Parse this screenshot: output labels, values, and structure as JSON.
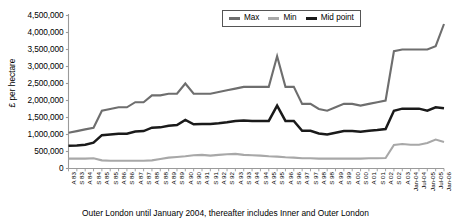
{
  "chart_data": {
    "type": "line",
    "title": "",
    "xlabel": "",
    "ylabel": "£ per hectare",
    "ylim": [
      0,
      4500000
    ],
    "ytick_values": [
      0,
      500000,
      1000000,
      1500000,
      2000000,
      2500000,
      3000000,
      3500000,
      4000000,
      4500000
    ],
    "ytick_labels": [
      "0",
      "500,000",
      "1,000,000",
      "1,500,000",
      "2,000,000",
      "2,500,000",
      "3,000,000",
      "3,500,000",
      "4,000,000",
      "4,500,000"
    ],
    "grid": false,
    "legend_position": "top-center",
    "categories": [
      "A 83",
      "S 83",
      "A 84",
      "S 84",
      "A 85",
      "S 85",
      "A 86",
      "S 86",
      "A 87",
      "S 87",
      "A 88",
      "S 88",
      "A 89",
      "S 89",
      "A 90",
      "S 90",
      "A 91",
      "S 91",
      "A 92",
      "S 92",
      "A 93",
      "S 93",
      "A 94",
      "S 94",
      "A 95",
      "S 95",
      "A 96",
      "S 96",
      "A 97",
      "S 97",
      "A 98",
      "S 98",
      "A 99",
      "S 99",
      "A 00",
      "S 00",
      "A 01",
      "S 01",
      "A 02",
      "S 02",
      "A 03",
      "Jan-04",
      "Jul-04",
      "Jan-05",
      "Jul-05",
      "Jan-06"
    ],
    "series": [
      {
        "name": "Max",
        "color": "#6e6e6e",
        "values": [
          1050000,
          1100000,
          1150000,
          1200000,
          1700000,
          1750000,
          1800000,
          1800000,
          1950000,
          1950000,
          2150000,
          2150000,
          2200000,
          2200000,
          2500000,
          2200000,
          2200000,
          2200000,
          2250000,
          2300000,
          2350000,
          2400000,
          2400000,
          2400000,
          2400000,
          3300000,
          2400000,
          2400000,
          1900000,
          1900000,
          1750000,
          1700000,
          1800000,
          1900000,
          1900000,
          1850000,
          1900000,
          1950000,
          2000000,
          3450000,
          3500000,
          3500000,
          3500000,
          3500000,
          3600000,
          4250000
        ]
      },
      {
        "name": "Min",
        "color": "#a8a8a8",
        "values": [
          290000,
          290000,
          290000,
          300000,
          240000,
          230000,
          230000,
          230000,
          230000,
          230000,
          240000,
          280000,
          320000,
          340000,
          360000,
          390000,
          400000,
          380000,
          400000,
          420000,
          430000,
          400000,
          390000,
          380000,
          360000,
          350000,
          330000,
          320000,
          300000,
          300000,
          290000,
          290000,
          290000,
          290000,
          290000,
          290000,
          300000,
          300000,
          310000,
          690000,
          720000,
          700000,
          700000,
          750000,
          850000,
          780000
        ]
      },
      {
        "name": "Mid point",
        "color": "#1a1a1a",
        "values": [
          670000,
          680000,
          700000,
          760000,
          980000,
          1000000,
          1020000,
          1020000,
          1090000,
          1100000,
          1200000,
          1210000,
          1260000,
          1280000,
          1430000,
          1300000,
          1310000,
          1310000,
          1330000,
          1360000,
          1400000,
          1410000,
          1400000,
          1400000,
          1400000,
          1850000,
          1400000,
          1400000,
          1110000,
          1110000,
          1030000,
          1000000,
          1050000,
          1100000,
          1100000,
          1080000,
          1110000,
          1130000,
          1160000,
          1700000,
          1760000,
          1760000,
          1760000,
          1700000,
          1800000,
          1770000
        ]
      }
    ],
    "caption": "Outer London until January 2004, thereafter includes Inner and Outer London"
  },
  "legend": {
    "items": [
      {
        "label": "Max",
        "color": "#6e6e6e"
      },
      {
        "label": "Min",
        "color": "#a8a8a8"
      },
      {
        "label": "Mid point",
        "color": "#1a1a1a"
      }
    ]
  },
  "axis": {
    "y_title": "£ per hectare",
    "axis_color": "#9a9a9a"
  },
  "footer": {
    "caption": "Outer London until January 2004, thereafter includes Inner and Outer London"
  }
}
